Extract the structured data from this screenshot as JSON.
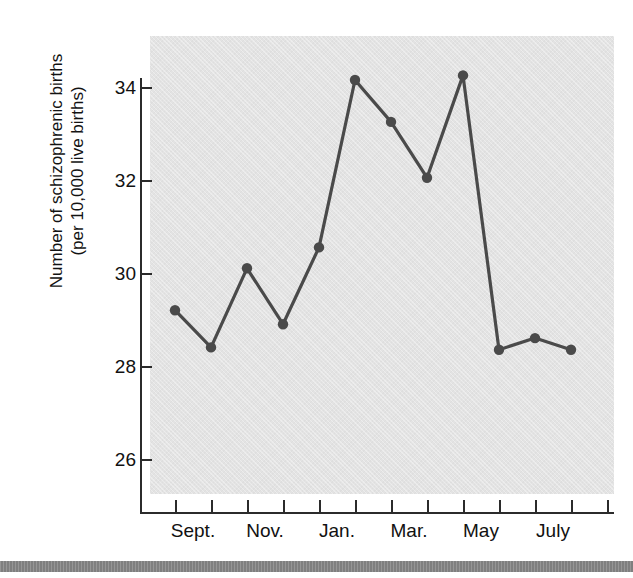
{
  "figure": {
    "top_clipped_text": "",
    "bottom_rule_color": "#7f7f7f",
    "plot_background_color": "#e3e3e3",
    "line_color": "#4a4a4a",
    "marker_color": "#4a4a4a",
    "axis_color": "#2b2b2b"
  },
  "chart_data": {
    "type": "line",
    "title": "",
    "xlabel": "",
    "ylabel": "Number of schizophrenic births\n(per 10,000 live births)",
    "ylabel_line1": "Number of schizophrenic births",
    "ylabel_line2": "(per 10,000 live births)",
    "ylim": [
      25.2,
      35.0
    ],
    "yticks": [
      26,
      28,
      30,
      32,
      34
    ],
    "ytick_labels": [
      "26",
      "28",
      "30",
      "32",
      "34"
    ],
    "grid": false,
    "legend": "none",
    "x_tick_count": 13,
    "categories": [
      "Sept.",
      "Oct.",
      "Nov.",
      "Dec.",
      "Jan.",
      "Feb.",
      "Mar.",
      "Apr.",
      "May",
      "June",
      "July",
      "Aug."
    ],
    "xtick_labels_shown": [
      "Sept.",
      "Nov.",
      "Jan.",
      "Mar.",
      "May",
      "July"
    ],
    "values": [
      29.2,
      28.4,
      30.1,
      28.9,
      30.55,
      34.15,
      33.25,
      32.05,
      34.25,
      28.35,
      28.6,
      28.35
    ],
    "points": [
      {
        "category": "Sept.",
        "value": 29.2
      },
      {
        "category": "Oct.",
        "value": 28.4
      },
      {
        "category": "Nov.",
        "value": 30.1
      },
      {
        "category": "Dec.",
        "value": 28.9
      },
      {
        "category": "Jan.",
        "value": 30.55
      },
      {
        "category": "Feb.",
        "value": 34.15
      },
      {
        "category": "Mar.",
        "value": 33.25
      },
      {
        "category": "Apr.",
        "value": 32.05
      },
      {
        "category": "May",
        "value": 34.25
      },
      {
        "category": "June",
        "value": 28.35
      },
      {
        "category": "July",
        "value": 28.6
      },
      {
        "category": "Aug.",
        "value": 28.35
      }
    ]
  }
}
